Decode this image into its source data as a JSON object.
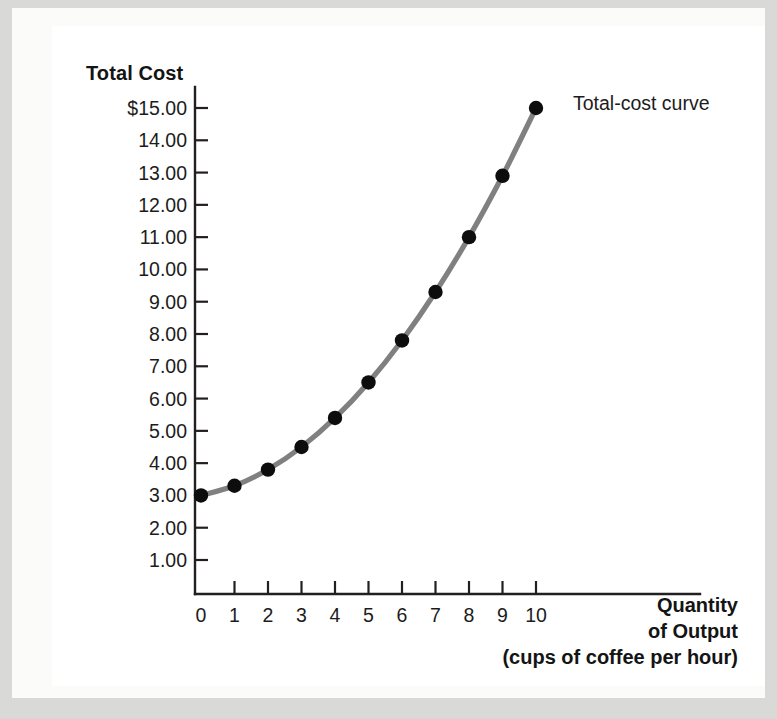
{
  "chart_data": {
    "type": "line",
    "title": "",
    "xlabel": "Quantity of Output (cups of coffee per hour)",
    "ylabel": "Total Cost",
    "x": [
      0,
      1,
      2,
      3,
      4,
      5,
      6,
      7,
      8,
      9,
      10
    ],
    "values": [
      3.0,
      3.3,
      3.8,
      4.5,
      5.4,
      6.5,
      7.8,
      9.3,
      11.0,
      12.9,
      15.0
    ],
    "series": [
      {
        "name": "Total-cost curve",
        "values": [
          3.0,
          3.3,
          3.8,
          4.5,
          5.4,
          6.5,
          7.8,
          9.3,
          11.0,
          12.9,
          15.0
        ]
      }
    ],
    "xlim": [
      0,
      10
    ],
    "ylim": [
      0,
      15
    ],
    "grid": false,
    "legend_position": "none",
    "annotations": [
      "Total-cost curve"
    ],
    "line_color": "#808080",
    "marker_color": "#0d0d0d",
    "axis_color": "#231f20"
  },
  "axes": {
    "y_title": "Total Cost",
    "y_ticks": [
      "$15.00",
      "14.00",
      "13.00",
      "12.00",
      "11.00",
      "10.00",
      "9.00",
      "8.00",
      "7.00",
      "6.00",
      "5.00",
      "4.00",
      "3.00",
      "2.00",
      "1.00"
    ],
    "y_tick_values": [
      15,
      14,
      13,
      12,
      11,
      10,
      9,
      8,
      7,
      6,
      5,
      4,
      3,
      2,
      1
    ],
    "x_ticks": [
      "0",
      "1",
      "2",
      "3",
      "4",
      "5",
      "6",
      "7",
      "8",
      "9",
      "10"
    ],
    "x_tick_values": [
      0,
      1,
      2,
      3,
      4,
      5,
      6,
      7,
      8,
      9,
      10
    ],
    "x_title_lines": [
      "Quantity",
      "of Output",
      "(cups of coffee per hour)"
    ]
  },
  "annotation": {
    "curve_label": "Total-cost curve"
  }
}
